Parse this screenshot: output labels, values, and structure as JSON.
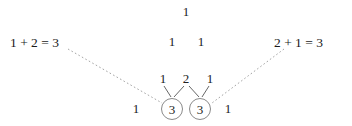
{
  "diagram": {
    "title_text": "",
    "background_color": "#ffffff",
    "text_color": "#222222",
    "solid_line_color": "#555555",
    "dashed_line_color": "#9a9a9a",
    "circle_stroke_color": "#8a8a8a",
    "triangle_rows": [
      {
        "row_index": 0,
        "cells": [
          {
            "value": "1",
            "x": 186,
            "y": 12,
            "circled": false
          }
        ]
      },
      {
        "row_index": 1,
        "cells": [
          {
            "value": "1",
            "x": 172,
            "y": 42,
            "circled": false
          },
          {
            "value": "1",
            "x": 201,
            "y": 42,
            "circled": false
          }
        ]
      },
      {
        "row_index": 2,
        "cells": [
          {
            "value": "1",
            "x": 163,
            "y": 79,
            "circled": false
          },
          {
            "value": "2",
            "x": 186,
            "y": 79,
            "circled": false
          },
          {
            "value": "1",
            "x": 210,
            "y": 79,
            "circled": false
          }
        ]
      },
      {
        "row_index": 3,
        "cells": [
          {
            "value": "1",
            "x": 136,
            "y": 109,
            "circled": false
          },
          {
            "value": "3",
            "x": 172,
            "y": 109,
            "circled": true
          },
          {
            "value": "3",
            "x": 200,
            "y": 109,
            "circled": true
          },
          {
            "value": "1",
            "x": 228,
            "y": 109,
            "circled": false
          }
        ]
      }
    ],
    "annotations": [
      {
        "id": "left-sum",
        "text": "1 + 2 = 3",
        "side": "left"
      },
      {
        "id": "right-sum",
        "text": "2 + 1 = 3",
        "side": "right"
      }
    ],
    "solid_connectors": [
      {
        "id": "one-to-left-three",
        "x1": 164,
        "y1": 86,
        "x2": 171,
        "y2": 97
      },
      {
        "id": "two-to-left-three",
        "x1": 184,
        "y1": 86,
        "x2": 174,
        "y2": 97
      },
      {
        "id": "two-to-right-three",
        "x1": 189,
        "y1": 86,
        "x2": 199,
        "y2": 97
      },
      {
        "id": "one-to-right-three",
        "x1": 209,
        "y1": 86,
        "x2": 202,
        "y2": 97
      }
    ],
    "dashed_connectors": [
      {
        "id": "left-annotation-leader",
        "x1": 68,
        "y1": 49,
        "x2": 162,
        "y2": 103
      },
      {
        "id": "right-annotation-leader",
        "x1": 284,
        "y1": 49,
        "x2": 212,
        "y2": 103
      }
    ]
  }
}
